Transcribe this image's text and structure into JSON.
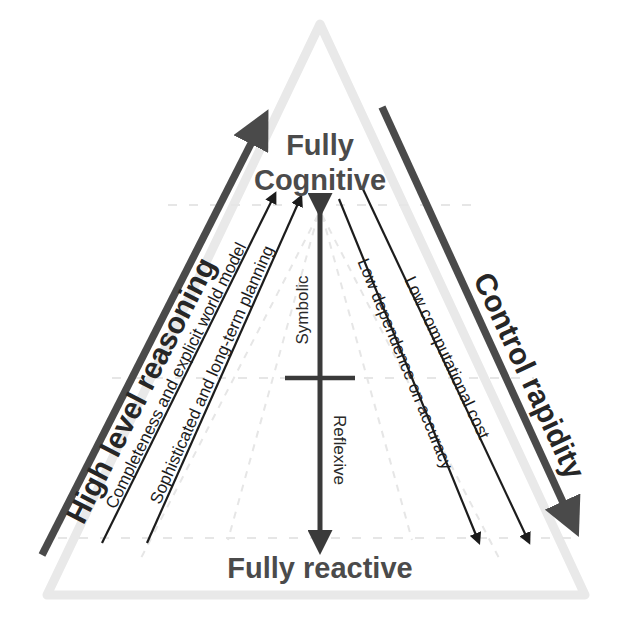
{
  "figure": {
    "background_color": "#ffffff",
    "triangle_outline_color": "#e8e8e8",
    "dashed_guide_color": "#e2e2e2",
    "heavy_arrow_color": "#4a4a4a",
    "thin_arrow_color": "#1c1c1c",
    "center_arrow_color": "#3a3a3a"
  },
  "poles": {
    "top_line1": "Fully",
    "top_line2": "Cognitive",
    "bottom": "Fully reactive"
  },
  "axes": {
    "left": "High level reasoning",
    "right": "Control rapidity"
  },
  "center_axis": {
    "upper_label": "Symbolic",
    "lower_label": "Reflexive"
  },
  "left_gradients": [
    "Completeness and explicit world model",
    "Sophisticated and long-term planning"
  ],
  "right_gradients": [
    "Low dependence on accuracy",
    "Low computational cost"
  ]
}
